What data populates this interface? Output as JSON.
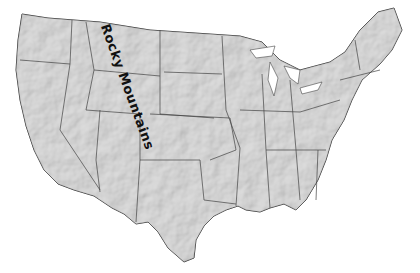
{
  "map": {
    "type": "shaded-relief map",
    "region": "Contiguous United States",
    "colors": {
      "land": "#d9d9d9",
      "border": "#444444",
      "background": "#ffffff"
    },
    "labels": [
      {
        "text": "Rocky Mountains",
        "x": 108,
        "y": 22,
        "rotation_deg": 70
      }
    ]
  }
}
